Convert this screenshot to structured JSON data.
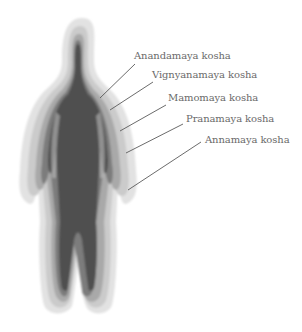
{
  "diagram": {
    "colors": {
      "background": "#ffffff",
      "layer_outer": "#dcdcdc",
      "layer_4": "#c4c4c4",
      "layer_3": "#a8a8a8",
      "layer_2": "#7a7a7a",
      "core": "#4a4a4a",
      "line": "#5a5a5a",
      "text": "#6a6a6a"
    },
    "labels": [
      {
        "text": "Anandamaya kosha",
        "x": 134,
        "y": 50,
        "line": [
          135,
          64,
          100,
          98
        ]
      },
      {
        "text": "Vignyanamaya kosha",
        "x": 152,
        "y": 69,
        "line": [
          153,
          82,
          110,
          110
        ]
      },
      {
        "text": "Mamomaya kosha",
        "x": 168,
        "y": 92,
        "line": [
          166,
          105,
          120,
          131
        ]
      },
      {
        "text": "Pranamaya kosha",
        "x": 186,
        "y": 113,
        "line": [
          183,
          124,
          126,
          153
        ]
      },
      {
        "text": "Annamaya kosha",
        "x": 205,
        "y": 134,
        "line": [
          201,
          142,
          128,
          190
        ]
      }
    ]
  }
}
